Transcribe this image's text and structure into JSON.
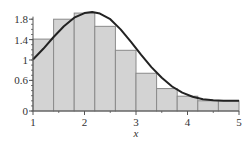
{
  "chart_data": {
    "type": "bar",
    "title": "",
    "xlabel": "x",
    "ylabel": "",
    "xlim": [
      1,
      5
    ],
    "ylim": [
      0,
      1.95
    ],
    "grid": false,
    "legend": null,
    "x_ticks": [
      1,
      2,
      3,
      4,
      5
    ],
    "x_tick_labels": [
      "1",
      "2",
      "3",
      "4",
      "5"
    ],
    "x_minor_ticks": [
      1.5,
      2.5,
      3.5,
      4.5
    ],
    "y_ticks": [
      0,
      0.6,
      1,
      1.4,
      1.8
    ],
    "y_tick_labels": [
      "0",
      "0.6",
      "1",
      "1.4",
      "1.8"
    ],
    "histogram": {
      "bin_edges": [
        1.0,
        1.4,
        1.8,
        2.2,
        2.6,
        3.0,
        3.4,
        3.8,
        4.2,
        4.6,
        5.0
      ],
      "values": [
        1.41,
        1.8,
        1.92,
        1.66,
        1.19,
        0.74,
        0.44,
        0.29,
        0.2,
        0.2
      ],
      "fill": "#d3d3d3",
      "edge": "#8a8a8a"
    },
    "curve": {
      "type": "line",
      "color": "#222222",
      "x": [
        1.0,
        1.2,
        1.4,
        1.6,
        1.8,
        2.0,
        2.15,
        2.3,
        2.5,
        2.7,
        2.9,
        3.1,
        3.3,
        3.5,
        3.7,
        3.9,
        4.1,
        4.3,
        4.5,
        4.7,
        5.0
      ],
      "y": [
        1.01,
        1.22,
        1.45,
        1.66,
        1.83,
        1.92,
        1.94,
        1.91,
        1.8,
        1.6,
        1.36,
        1.1,
        0.86,
        0.65,
        0.48,
        0.36,
        0.28,
        0.23,
        0.21,
        0.2,
        0.2
      ]
    }
  }
}
